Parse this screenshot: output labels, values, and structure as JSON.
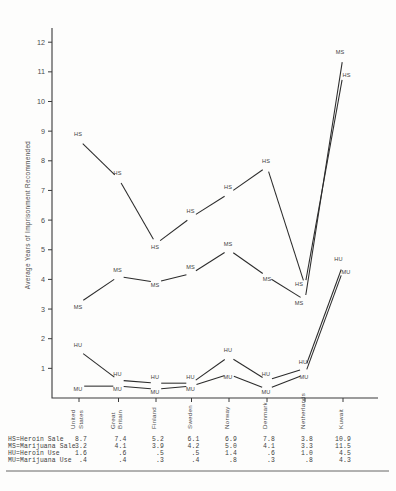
{
  "chart_data": {
    "type": "line",
    "title": "",
    "xlabel": "",
    "ylabel": "Average Years of Imprisonment Recommended",
    "ylim": [
      0,
      12.5
    ],
    "yticks": [
      1,
      2,
      3,
      4,
      5,
      6,
      7,
      8,
      9,
      10,
      11,
      12
    ],
    "grid": false,
    "legend_position": "below-table",
    "categories": [
      "United States",
      "Great Britain",
      "Finland",
      "Sweden",
      "Norway",
      "Denmark",
      "Netherlands",
      "Kuwait"
    ],
    "series": [
      {
        "name": "HS",
        "label": "HS=Heroin Sale",
        "values": [
          8.7,
          7.4,
          5.2,
          6.1,
          6.9,
          7.8,
          3.8,
          10.9
        ]
      },
      {
        "name": "MS",
        "label": "MS=Marijuana Sale",
        "values": [
          3.2,
          4.1,
          3.9,
          4.2,
          5.0,
          4.1,
          3.3,
          11.5
        ]
      },
      {
        "name": "HU",
        "label": "HU=Heroin Use",
        "values": [
          1.6,
          0.6,
          0.5,
          0.5,
          1.4,
          0.6,
          1.0,
          4.5
        ]
      },
      {
        "name": "MU",
        "label": "MU=Marijuana Use",
        "values": [
          0.4,
          0.4,
          0.3,
          0.4,
          0.8,
          0.3,
          0.8,
          4.3
        ]
      }
    ]
  },
  "table": {
    "row_labels": [
      "HS=Heroin Sale",
      "MS=Marijuana Sale",
      "HU=Heroin Use",
      "MU=Marijuana Use"
    ],
    "rows": [
      [
        "8.7",
        "7.4",
        "5.2",
        "6.1",
        "6.9",
        "7.8",
        "3.8",
        "10.9"
      ],
      [
        "3.2",
        "4.1",
        "3.9",
        "4.2",
        "5.0",
        "4.1",
        "3.3",
        "11.5"
      ],
      [
        "1.6",
        ".6",
        ".5",
        ".5",
        "1.4",
        ".6",
        "1.0",
        "4.5"
      ],
      [
        ".4",
        ".4",
        ".3",
        ".4",
        ".8",
        ".3",
        ".8",
        "4.3"
      ]
    ]
  },
  "colors": {
    "ink": "#2b2b2b",
    "axis": "#3a3a3a",
    "paper": "#fdfdfc"
  }
}
